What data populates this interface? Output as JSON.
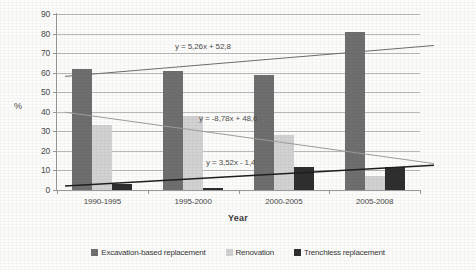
{
  "chart_data": {
    "type": "bar",
    "title": "",
    "subtitle": "",
    "xlabel": "Year",
    "ylabel": "%",
    "ylim": [
      0,
      90
    ],
    "ytick_step": 10,
    "yticks": [
      0,
      10,
      20,
      30,
      40,
      50,
      60,
      70,
      80,
      90
    ],
    "grid": true,
    "legend_position": "bottom",
    "categories": [
      "1990-1995",
      "1995-2000",
      "2000-2005",
      "2005-2008"
    ],
    "series": [
      {
        "name": "Excavation-based replacement",
        "color": "#6f6f6f",
        "values": [
          62,
          61,
          59,
          81
        ]
      },
      {
        "name": "Renovation",
        "color": "#d2d2d2",
        "values": [
          33,
          38,
          28,
          7
        ]
      },
      {
        "name": "Trenchless replacement",
        "color": "#2f2f2f",
        "values": [
          3,
          1,
          12,
          12
        ]
      }
    ],
    "trendlines": [
      {
        "for_series": "Excavation-based replacement",
        "equation": "y = 5,26x + 52,8",
        "slope": 5.26,
        "intercept": 52.8,
        "y_start": 58.1,
        "y_end": 73.9,
        "color": "#6f6f6f"
      },
      {
        "for_series": "Renovation",
        "equation": "y = -8,78x + 48,6",
        "slope": -8.78,
        "intercept": 48.6,
        "y_start": 39.8,
        "y_end": 13.5,
        "color": "#9e9e9e"
      },
      {
        "for_series": "Trenchless replacement",
        "equation": "y = 3,52x - 1,4",
        "slope": 3.52,
        "intercept": -1.4,
        "y_start": 2.1,
        "y_end": 12.7,
        "color": "#1f1f1f"
      }
    ]
  },
  "legend": {
    "items": [
      {
        "label": "Excavation-based replacement",
        "color": "#6f6f6f"
      },
      {
        "label": "Renovation",
        "color": "#d2d2d2"
      },
      {
        "label": "Trenchless replacement",
        "color": "#2f2f2f"
      }
    ]
  }
}
